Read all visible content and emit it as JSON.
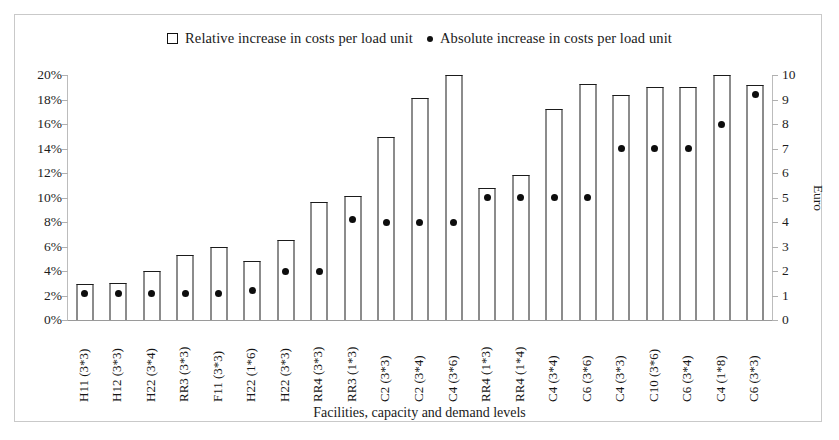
{
  "legend": {
    "relative": "Relative increase in costs per load unit",
    "absolute": "Absolute increase in costs per load unit",
    "relative_marker": "open-square-marker",
    "absolute_marker": "filled-dot-marker"
  },
  "axes": {
    "left_ticks": [
      "0%",
      "2%",
      "4%",
      "6%",
      "8%",
      "10%",
      "12%",
      "14%",
      "16%",
      "18%",
      "20%"
    ],
    "right_ticks": [
      "0",
      "1",
      "2",
      "3",
      "4",
      "5",
      "6",
      "7",
      "8",
      "9",
      "10"
    ],
    "right_title": "Euro",
    "x_title": "Facilities, capacity and demand levels"
  },
  "chart_data": {
    "type": "bar",
    "title": "",
    "xlabel": "Facilities, capacity and demand levels",
    "ylabel": "",
    "y2label": "Euro",
    "ylim": [
      0,
      20
    ],
    "y2lim": [
      0,
      10
    ],
    "grid": false,
    "legend_position": "top-center",
    "categories": [
      "H11 (3*3)",
      "H12 (3*3)",
      "H22 (3*4)",
      "RR3 (3*3)",
      "F11 (3*3)",
      "H22 (1*6)",
      "H22 (3*3)",
      "RR4 (3*3)",
      "RR3 (1*3)",
      "C2 (3*3)",
      "C2 (3*4)",
      "C4 (3*6)",
      "RR4 (1*3)",
      "RR4 (1*4)",
      "C4 (3*4)",
      "C6 (3*6)",
      "C4 (3*3)",
      "C10 (3*6)",
      "C6 (3*4)",
      "C4 (1*8)",
      "C6 (3*3)"
    ],
    "series": [
      {
        "name": "Relative increase in costs per load unit",
        "unit": "%",
        "axis": "left",
        "marker": "open-square",
        "values": [
          2.9,
          3.0,
          4.0,
          5.3,
          6.0,
          4.8,
          6.5,
          9.6,
          10.1,
          14.9,
          18.1,
          20.0,
          10.8,
          11.8,
          17.2,
          19.3,
          18.4,
          19.0,
          19.0,
          20.0,
          19.2
        ]
      },
      {
        "name": "Absolute increase in costs per load unit",
        "unit": "Euro",
        "axis": "right",
        "marker": "filled-dot",
        "values": [
          1.1,
          1.1,
          1.1,
          1.1,
          1.1,
          1.2,
          2.0,
          2.0,
          4.1,
          4.0,
          4.0,
          4.0,
          5.0,
          5.0,
          5.0,
          5.0,
          7.0,
          7.0,
          7.0,
          8.0,
          9.2
        ]
      }
    ]
  }
}
